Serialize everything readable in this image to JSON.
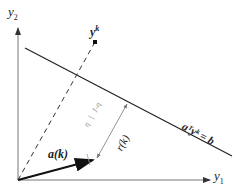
{
  "diagram": {
    "axes": {
      "y_axis_label": "y",
      "y_axis_sub": "2",
      "x_axis_label": "y",
      "x_axis_sub": "1"
    },
    "point_label": "y",
    "point_sup": "k",
    "vector_label": "a(k)",
    "distance_label": "r(k)",
    "ratio_label_a": "η",
    "ratio_label_sep": "|",
    "ratio_label_b": "1-η",
    "hyperplane_label": "aᵀyᵏ = b",
    "colors": {
      "axis": "#555555",
      "line": "#222222",
      "vector": "#111111",
      "distance": "#888888"
    }
  }
}
